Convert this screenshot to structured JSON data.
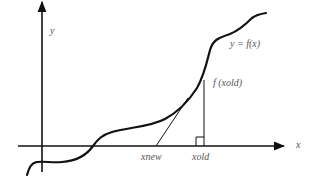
{
  "diagram": {
    "colors": {
      "background": "#ffffff",
      "stroke": "#111111",
      "label": "#555555"
    },
    "axes": {
      "x_label": "x",
      "y_label": "y"
    },
    "curve": {
      "label": "y = f(x)"
    },
    "point_label": "f (xold)",
    "tick_labels": {
      "xnew": "xnew",
      "xold": "xold"
    }
  }
}
